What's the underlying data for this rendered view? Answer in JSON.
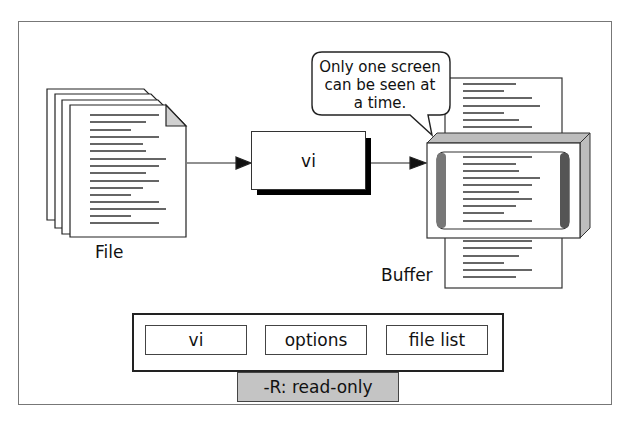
{
  "diagram": {
    "file_label": "File",
    "program_label": "vi",
    "buffer_label": "Buffer",
    "callout_lines": [
      "Only one screen",
      "can be seen at",
      "a time."
    ],
    "command_bar": {
      "segments": [
        "vi",
        "options",
        "file list"
      ],
      "option_detail": "-R: read-only"
    },
    "colors": {
      "line": "#222222",
      "shadow": "#000000",
      "option_fill": "#c4c4c4",
      "frame": "#777777"
    }
  }
}
